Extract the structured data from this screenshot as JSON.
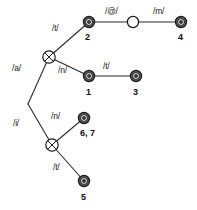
{
  "diagram": {
    "type": "node-link-graph",
    "stroke_color": "#2b2b2b",
    "node_fill_dark": "#565656",
    "node_fill_open": "#ffffff",
    "background": "#ffffff",
    "nodes": [
      {
        "id": "root",
        "x": 28,
        "y": 104,
        "shape": "junction",
        "label": ""
      },
      {
        "id": "cross-1",
        "x": 49,
        "y": 57,
        "shape": "crossed-circle",
        "label": ""
      },
      {
        "id": "n2",
        "x": 89,
        "y": 22,
        "shape": "double-circle",
        "label": "2"
      },
      {
        "id": "open-1",
        "x": 133,
        "y": 22,
        "shape": "open-circle",
        "label": ""
      },
      {
        "id": "n4",
        "x": 181,
        "y": 22,
        "shape": "double-circle",
        "label": "4"
      },
      {
        "id": "n1",
        "x": 89,
        "y": 76,
        "shape": "double-circle",
        "label": "1"
      },
      {
        "id": "n3",
        "x": 136,
        "y": 76,
        "shape": "double-circle",
        "label": "3"
      },
      {
        "id": "n67",
        "x": 84,
        "y": 118,
        "shape": "double-circle",
        "label": "6, 7"
      },
      {
        "id": "cross-2",
        "x": 52,
        "y": 145,
        "shape": "crossed-circle",
        "label": ""
      },
      {
        "id": "n5",
        "x": 84,
        "y": 181,
        "shape": "double-circle",
        "label": "5"
      }
    ],
    "edges": [
      {
        "from": "root",
        "to": "cross-1",
        "label": "/a/"
      },
      {
        "from": "cross-1",
        "to": "n2",
        "label": "/t/"
      },
      {
        "from": "n2",
        "to": "open-1",
        "label": "/@/"
      },
      {
        "from": "open-1",
        "to": "n4",
        "label": "/m/"
      },
      {
        "from": "cross-1",
        "to": "n1",
        "label": "/n/"
      },
      {
        "from": "n1",
        "to": "n3",
        "label": "/t/"
      },
      {
        "from": "root",
        "to": "cross-2",
        "label": "/i/"
      },
      {
        "from": "cross-2",
        "to": "n67",
        "label": "/n/"
      },
      {
        "from": "cross-2",
        "to": "n5",
        "label": "/t/"
      }
    ],
    "edge_labels": [
      {
        "id": "lbl-a",
        "text": "/a/",
        "x": 12,
        "y": 64
      },
      {
        "id": "lbl-t1",
        "text": "/t/",
        "x": 52,
        "y": 24
      },
      {
        "id": "lbl-at",
        "text": "/@/",
        "x": 105,
        "y": 7
      },
      {
        "id": "lbl-m",
        "text": "/m/",
        "x": 153,
        "y": 7
      },
      {
        "id": "lbl-n1",
        "text": "/n/",
        "x": 58,
        "y": 66
      },
      {
        "id": "lbl-t2",
        "text": "/t/",
        "x": 103,
        "y": 62
      },
      {
        "id": "lbl-i",
        "text": "/i/",
        "x": 13,
        "y": 119
      },
      {
        "id": "lbl-n2",
        "text": "/n/",
        "x": 51,
        "y": 112
      },
      {
        "id": "lbl-t3",
        "text": "/t/",
        "x": 53,
        "y": 163
      }
    ],
    "node_labels": [
      {
        "id": "num-2",
        "text": "2",
        "x": 85,
        "y": 33
      },
      {
        "id": "num-4",
        "text": "4",
        "x": 178,
        "y": 33
      },
      {
        "id": "num-1",
        "text": "1",
        "x": 86,
        "y": 88
      },
      {
        "id": "num-3",
        "text": "3",
        "x": 133,
        "y": 88
      },
      {
        "id": "num-67",
        "text": "6, 7",
        "x": 80,
        "y": 129
      },
      {
        "id": "num-5",
        "text": "5",
        "x": 81,
        "y": 193
      }
    ]
  }
}
